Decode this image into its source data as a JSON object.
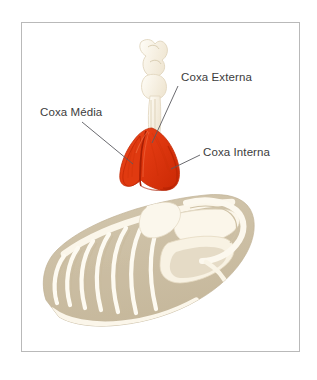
{
  "figure": {
    "type": "anatomical-illustration",
    "background_color": "#ffffff",
    "border_color": "#b9b9b9",
    "muscle_color": "#e23a11",
    "muscle_shadow_color": "#b82405",
    "muscle_seam_color": "#a81e04",
    "bone_color": "#f6efe0",
    "bone_outline_color": "#e3d8c2",
    "body_color": "#cdc0a6",
    "leader_line_color": "#5a5a60",
    "label_text_color": "#3c3c3c"
  },
  "labels": [
    {
      "id": "coxa-externa",
      "text": "Coxa Externa",
      "position": {
        "x": 181,
        "y": 71
      },
      "leader": {
        "from_x": 178,
        "from_y": 88,
        "to_x": 152,
        "to_y": 143
      }
    },
    {
      "id": "coxa-media",
      "text": "Coxa Média",
      "position": {
        "x": 40,
        "y": 106
      },
      "leader": {
        "from_x": 80,
        "from_y": 123,
        "to_x": 133,
        "to_y": 163
      }
    },
    {
      "id": "coxa-interna",
      "text": "Coxa Interna",
      "position": {
        "x": 203,
        "y": 146
      },
      "leader": {
        "from_x": 200,
        "from_y": 156,
        "to_x": 172,
        "to_y": 170
      }
    }
  ]
}
